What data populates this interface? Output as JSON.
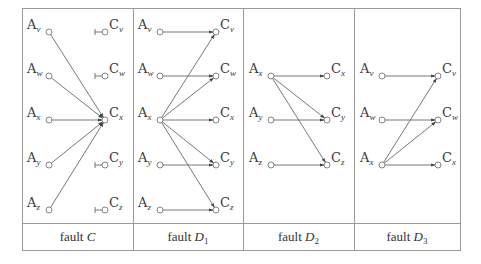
{
  "figure": {
    "panels": [
      {
        "caption": {
          "prefix": "fault ",
          "symbol": "C",
          "subscript": ""
        },
        "a_nodes": [
          {
            "label": "A",
            "sub": "v",
            "y": 32
          },
          {
            "label": "A",
            "sub": "w",
            "y": 76
          },
          {
            "label": "A",
            "sub": "x",
            "y": 120
          },
          {
            "label": "A",
            "sub": "y",
            "y": 165
          },
          {
            "label": "A",
            "sub": "z",
            "y": 210
          }
        ],
        "c_nodes": [
          {
            "label": "C",
            "sub": "v",
            "y": 32,
            "stub": true
          },
          {
            "label": "C",
            "sub": "w",
            "y": 76,
            "stub": true
          },
          {
            "label": "C",
            "sub": "x",
            "y": 120,
            "stub": false
          },
          {
            "label": "C",
            "sub": "y",
            "y": 165,
            "stub": true
          },
          {
            "label": "C",
            "sub": "z",
            "y": 210,
            "stub": true
          }
        ],
        "edges": [
          [
            "v",
            "x"
          ],
          [
            "w",
            "x"
          ],
          [
            "x",
            "x"
          ],
          [
            "y",
            "x"
          ],
          [
            "z",
            "x"
          ]
        ]
      },
      {
        "caption": {
          "prefix": "fault ",
          "symbol": "D",
          "subscript": "1"
        },
        "a_nodes": [
          {
            "label": "A",
            "sub": "v",
            "y": 32
          },
          {
            "label": "A",
            "sub": "w",
            "y": 76
          },
          {
            "label": "A",
            "sub": "x",
            "y": 120
          },
          {
            "label": "A",
            "sub": "y",
            "y": 165
          },
          {
            "label": "A",
            "sub": "z",
            "y": 210
          }
        ],
        "c_nodes": [
          {
            "label": "C",
            "sub": "v",
            "y": 32,
            "stub": false
          },
          {
            "label": "C",
            "sub": "w",
            "y": 76,
            "stub": false
          },
          {
            "label": "C",
            "sub": "x",
            "y": 120,
            "stub": false
          },
          {
            "label": "C",
            "sub": "y",
            "y": 165,
            "stub": false
          },
          {
            "label": "C",
            "sub": "z",
            "y": 210,
            "stub": false
          }
        ],
        "edges": [
          [
            "v",
            "v"
          ],
          [
            "w",
            "w"
          ],
          [
            "x",
            "v"
          ],
          [
            "x",
            "w"
          ],
          [
            "x",
            "x"
          ],
          [
            "x",
            "y"
          ],
          [
            "x",
            "z"
          ],
          [
            "y",
            "y"
          ],
          [
            "z",
            "z"
          ]
        ]
      },
      {
        "caption": {
          "prefix": "fault ",
          "symbol": "D",
          "subscript": "2"
        },
        "a_nodes": [
          {
            "label": "A",
            "sub": "x",
            "y": 76
          },
          {
            "label": "A",
            "sub": "y",
            "y": 120
          },
          {
            "label": "A",
            "sub": "z",
            "y": 165
          }
        ],
        "c_nodes": [
          {
            "label": "C",
            "sub": "x",
            "y": 76,
            "stub": false
          },
          {
            "label": "C",
            "sub": "y",
            "y": 120,
            "stub": false
          },
          {
            "label": "C",
            "sub": "z",
            "y": 165,
            "stub": false
          }
        ],
        "edges": [
          [
            "x",
            "x"
          ],
          [
            "x",
            "y"
          ],
          [
            "x",
            "z"
          ],
          [
            "y",
            "y"
          ],
          [
            "z",
            "z"
          ]
        ]
      },
      {
        "caption": {
          "prefix": "fault ",
          "symbol": "D",
          "subscript": "3"
        },
        "a_nodes": [
          {
            "label": "A",
            "sub": "v",
            "y": 76
          },
          {
            "label": "A",
            "sub": "w",
            "y": 120
          },
          {
            "label": "A",
            "sub": "x",
            "y": 165
          }
        ],
        "c_nodes": [
          {
            "label": "C",
            "sub": "v",
            "y": 76,
            "stub": false
          },
          {
            "label": "C",
            "sub": "w",
            "y": 120,
            "stub": false
          },
          {
            "label": "C",
            "sub": "x",
            "y": 165,
            "stub": false
          }
        ],
        "edges": [
          [
            "v",
            "v"
          ],
          [
            "w",
            "w"
          ],
          [
            "x",
            "v"
          ],
          [
            "x",
            "w"
          ],
          [
            "x",
            "x"
          ]
        ]
      }
    ]
  }
}
